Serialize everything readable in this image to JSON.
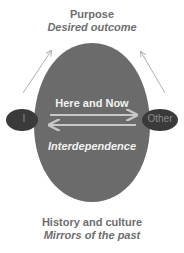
{
  "diagram": {
    "top": {
      "title": "Purpose",
      "subtitle": "Desired outcome"
    },
    "bottom": {
      "title": "History and culture",
      "subtitle": "Mirrors of the past"
    },
    "center": {
      "upper_text": "Here and Now",
      "lower_text": "Interdependence"
    },
    "nodes": {
      "left": "I",
      "right": "Other"
    },
    "colors": {
      "oval": "#6b6b6b",
      "nodes": "#3a3a3a",
      "text_outer": "#6e6e6e",
      "text_inner": "#f2f2f2",
      "arrows": "#b5b5b5"
    }
  }
}
